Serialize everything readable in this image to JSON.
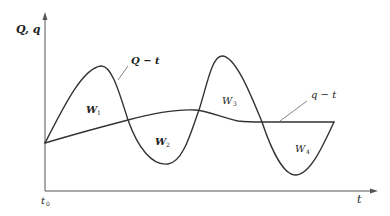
{
  "diagram": {
    "title": "",
    "axes": {
      "y_label": "Q, q",
      "x_label": "t",
      "origin_label": "t",
      "origin_subscript": "0"
    },
    "curves": [
      {
        "id": "Q",
        "label": "Q − t",
        "description": "Inflow / demand curve oscillating above and below q"
      },
      {
        "id": "q",
        "label": "q − t",
        "description": "Smooth, nearly flat curve"
      }
    ],
    "regions": [
      {
        "id": "W1",
        "label": "W",
        "subscript": "1"
      },
      {
        "id": "W2",
        "label": "W",
        "subscript": "2"
      },
      {
        "id": "W3",
        "label": "W",
        "subscript": "3"
      },
      {
        "id": "W4",
        "label": "W",
        "subscript": "4"
      }
    ],
    "colors": {
      "curve": "#333333",
      "axis": "#555555",
      "background": "#ffffff"
    }
  }
}
